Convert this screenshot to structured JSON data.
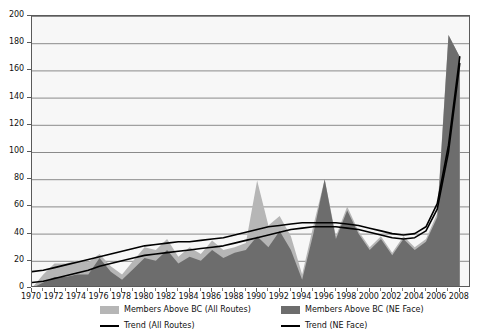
{
  "chart_data": {
    "type": "area",
    "title": "",
    "subtitle": "",
    "xlabel": "",
    "ylabel": "",
    "xlim": [
      1970,
      2009
    ],
    "ylim": [
      0,
      200
    ],
    "grid": true,
    "legend_position": "bottom",
    "y_ticks": [
      0,
      20,
      40,
      60,
      80,
      100,
      120,
      140,
      160,
      180,
      200
    ],
    "x_ticks": [
      1970,
      1972,
      1974,
      1976,
      1978,
      1980,
      1982,
      1984,
      1986,
      1988,
      1990,
      1992,
      1994,
      1996,
      1998,
      2000,
      2002,
      2004,
      2006,
      2008
    ],
    "x_minor_ticks": [
      1971,
      1973,
      1975,
      1977,
      1979,
      1981,
      1983,
      1985,
      1987,
      1989,
      1991,
      1993,
      1995,
      1997,
      1999,
      2001,
      2003,
      2005,
      2007
    ],
    "colors": {
      "area_all_routes": "#b6b6b6",
      "area_ne_face": "#6d6d6d",
      "trend_all_routes": "#000000",
      "trend_ne_face": "#000000",
      "plot_background": "#f7f7f7",
      "gridline": "#8a8a8a",
      "frame": "#5a5a5a"
    },
    "x": [
      1970,
      1971,
      1972,
      1973,
      1974,
      1975,
      1976,
      1977,
      1978,
      1979,
      1980,
      1981,
      1982,
      1983,
      1984,
      1985,
      1986,
      1987,
      1988,
      1989,
      1990,
      1991,
      1992,
      1993,
      1994,
      1995,
      1996,
      1997,
      1998,
      1999,
      2000,
      2001,
      2002,
      2003,
      2004,
      2005,
      2006,
      2007,
      2008
    ],
    "series": [
      {
        "name": "Members Above BC (All Routes)",
        "kind": "area",
        "color": "#b6b6b6",
        "values": [
          0,
          10,
          18,
          18,
          20,
          19,
          25,
          16,
          10,
          20,
          30,
          28,
          36,
          23,
          30,
          25,
          35,
          28,
          30,
          33,
          79,
          46,
          53,
          38,
          10,
          46,
          80,
          38,
          60,
          42,
          30,
          38,
          26,
          38,
          30,
          36,
          55,
          186,
          170
        ]
      },
      {
        "name": "Members Above BC (NE Face)",
        "kind": "area",
        "color": "#6d6d6d",
        "values": [
          0,
          4,
          8,
          8,
          10,
          10,
          22,
          12,
          6,
          14,
          22,
          20,
          28,
          18,
          23,
          20,
          28,
          22,
          26,
          28,
          38,
          30,
          42,
          28,
          6,
          40,
          80,
          36,
          57,
          40,
          28,
          36,
          24,
          36,
          28,
          34,
          52,
          186,
          170
        ]
      },
      {
        "name": "Trend (All Routes)",
        "kind": "line",
        "color": "#000000",
        "values": [
          12,
          13,
          15,
          17,
          19,
          21,
          23,
          25,
          27,
          29,
          31,
          32,
          33,
          34,
          34,
          35,
          36,
          37,
          39,
          41,
          43,
          45,
          46,
          47,
          48,
          48,
          48,
          48,
          47,
          46,
          44,
          42,
          40,
          39,
          40,
          45,
          62,
          105,
          170
        ]
      },
      {
        "name": "Trend (NE Face)",
        "kind": "line",
        "color": "#000000",
        "values": [
          4,
          5,
          7,
          9,
          11,
          13,
          16,
          18,
          20,
          22,
          24,
          25,
          26,
          27,
          28,
          29,
          30,
          31,
          33,
          35,
          37,
          39,
          41,
          43,
          44,
          45,
          45,
          45,
          44,
          43,
          41,
          39,
          37,
          36,
          37,
          42,
          58,
          100,
          165
        ]
      }
    ]
  },
  "legend": {
    "items": [
      {
        "label": "Members Above BC (All Routes)",
        "marker": "swatch-light"
      },
      {
        "label": "Trend (All Routes)",
        "marker": "line-black"
      },
      {
        "label": "Members Above BC (NE Face)",
        "marker": "swatch-dark"
      },
      {
        "label": "Trend (NE Face)",
        "marker": "line-black"
      }
    ]
  }
}
